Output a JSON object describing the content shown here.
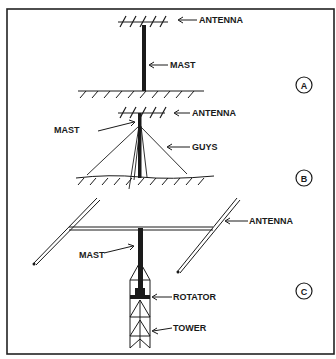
{
  "diagram": {
    "panels": [
      {
        "id": "A",
        "badge": "A",
        "labels": {
          "antenna": "ANTENNA",
          "mast": "MAST"
        }
      },
      {
        "id": "B",
        "badge": "B",
        "labels": {
          "antenna": "ANTENNA",
          "mast": "MAST",
          "guys": "GUYS"
        }
      },
      {
        "id": "C",
        "badge": "C",
        "labels": {
          "antenna": "ANTENNA",
          "mast": "MAST",
          "rotator": "ROTATOR",
          "tower": "TOWER"
        }
      }
    ],
    "colors": {
      "ink": "#1a1a1a",
      "background": "#ffffff",
      "border": "#222222"
    }
  }
}
